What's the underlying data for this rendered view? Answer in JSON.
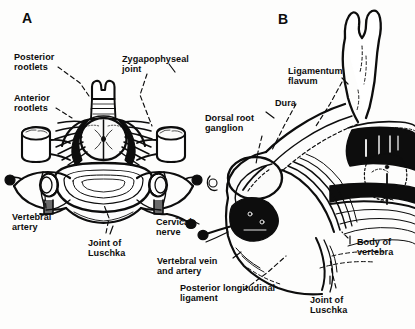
{
  "figure": {
    "type": "anatomical-line-drawing",
    "background_color": "#fdfdfc",
    "ink_color": "#0d0d0d",
    "panels": [
      {
        "id": "A",
        "letter": "A",
        "view": "axial cervical vertebra with spinal cord and nerve roots",
        "x": 22,
        "y": 17
      },
      {
        "id": "B",
        "letter": "B",
        "view": "oblique sagittal section of cervical spine",
        "x": 278,
        "y": 18
      }
    ],
    "labels": [
      {
        "id": "posterior-rootlets",
        "text": "Posterior\nrootlets",
        "panel": "A",
        "x": 14,
        "y": 52,
        "align": "left"
      },
      {
        "id": "anterior-rootlets",
        "text": "Anterior\nrootlets",
        "panel": "A",
        "x": 14,
        "y": 93,
        "align": "left"
      },
      {
        "id": "zygapophyseal-joint",
        "text": "Zygapophyseal\njoint",
        "panel": "A",
        "x": 122,
        "y": 54,
        "align": "left"
      },
      {
        "id": "vertebral-artery",
        "text": "Vertebral\nartery",
        "panel": "A",
        "x": 12,
        "y": 212,
        "align": "left"
      },
      {
        "id": "joint-of-luschka-a",
        "text": "Joint of\nLuschka",
        "panel": "A",
        "x": 88,
        "y": 238,
        "align": "left"
      },
      {
        "id": "cervical-nerve",
        "text": "Cervical\nnerve",
        "panel": "A",
        "x": 156,
        "y": 217,
        "align": "left"
      },
      {
        "id": "dorsal-root-ganglion",
        "text": "Dorsal root\nganglion",
        "panel": "B",
        "x": 205,
        "y": 113,
        "align": "left"
      },
      {
        "id": "ligamentum-flavum",
        "text": "Ligamentum\nflavum",
        "panel": "B",
        "x": 288,
        "y": 66,
        "align": "left"
      },
      {
        "id": "dura",
        "text": "Dura",
        "panel": "B",
        "x": 275,
        "y": 98,
        "align": "left"
      },
      {
        "id": "body-of-vertebra",
        "text": "Body of\nvertebra",
        "panel": "B",
        "x": 357,
        "y": 237,
        "align": "left"
      },
      {
        "id": "vertebral-vein-and-artery",
        "text": "Vertebral vein\nand artery",
        "panel": "B",
        "x": 157,
        "y": 256,
        "align": "left"
      },
      {
        "id": "posterior-longitudinal-ligament",
        "text": "Posterior longitudinal\nligament",
        "panel": "B",
        "x": 180,
        "y": 283,
        "align": "left"
      },
      {
        "id": "joint-of-luschka-b",
        "text": "Joint of\nLuschka",
        "panel": "B",
        "x": 310,
        "y": 295,
        "align": "left"
      }
    ]
  }
}
